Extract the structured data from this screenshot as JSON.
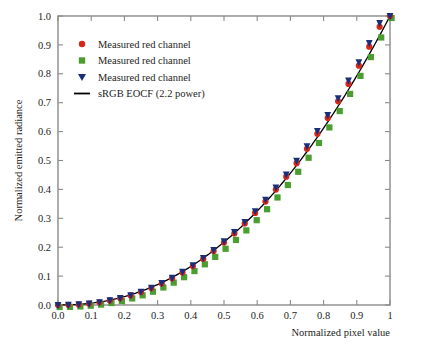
{
  "chart_data": {
    "type": "scatter",
    "title": "",
    "xlabel": "Normalized pixel value",
    "ylabel": "Normalized emitted radiance",
    "xlim": [
      0,
      1
    ],
    "ylim": [
      0,
      1
    ],
    "grid": false,
    "legend_position": "upper-left",
    "xticks": [
      0,
      0.1,
      0.2,
      0.3,
      0.4,
      0.5,
      0.6,
      0.7,
      0.8,
      0.9,
      1
    ],
    "xticklabels": [
      "0.0",
      "0.1",
      "0.2",
      "0.3",
      "0.4",
      "0.5",
      "0.6",
      "0.7",
      "0.8",
      "0.9",
      "1"
    ],
    "yticks": [
      0,
      0.1,
      0.2,
      0.3,
      0.4,
      0.5,
      0.6,
      0.7,
      0.8,
      0.9,
      1.0
    ],
    "yticklabels": [
      "0.0",
      "0.1",
      "0.2",
      "0.3",
      "0.4",
      "0.5",
      "0.6",
      "0.7",
      "0.8",
      "0.9",
      "1.0"
    ],
    "x": [
      0,
      0.03125,
      0.0625,
      0.09375,
      0.125,
      0.15625,
      0.1875,
      0.21875,
      0.25,
      0.28125,
      0.3125,
      0.34375,
      0.375,
      0.40625,
      0.4375,
      0.46875,
      0.5,
      0.53125,
      0.5625,
      0.59375,
      0.625,
      0.65625,
      0.6875,
      0.71875,
      0.75,
      0.78125,
      0.8125,
      0.84375,
      0.875,
      0.90625,
      0.9375,
      0.96875,
      1
    ],
    "series": [
      {
        "name": "Measured red channel",
        "marker": "circle",
        "color": "#d62718",
        "values": [
          0.0,
          0.0005,
          0.0021,
          0.0051,
          0.0095,
          0.0156,
          0.0235,
          0.0332,
          0.0449,
          0.0586,
          0.0744,
          0.0924,
          0.1125,
          0.1349,
          0.1596,
          0.1866,
          0.216,
          0.2478,
          0.282,
          0.3187,
          0.3579,
          0.3996,
          0.4439,
          0.4908,
          0.5403,
          0.5925,
          0.6473,
          0.7048,
          0.7651,
          0.8281,
          0.8939,
          0.9625,
          1.0
        ]
      },
      {
        "name": "Measured red channel",
        "marker": "square",
        "color": "#4a9e2f",
        "values": [
          0.0,
          0.0004,
          0.0018,
          0.0044,
          0.0083,
          0.0137,
          0.0208,
          0.0296,
          0.0403,
          0.0529,
          0.0675,
          0.0843,
          0.1032,
          0.1243,
          0.1477,
          0.1734,
          0.2015,
          0.232,
          0.265,
          0.3004,
          0.3384,
          0.379,
          0.4221,
          0.4679,
          0.5164,
          0.5675,
          0.6214,
          0.678,
          0.7374,
          0.7996,
          0.8647,
          0.9326,
          1.0
        ]
      },
      {
        "name": "Measured red channel",
        "marker": "triangle-down",
        "color": "#1a2e7a",
        "values": [
          0.0,
          0.0005,
          0.0022,
          0.0053,
          0.0098,
          0.016,
          0.0241,
          0.034,
          0.046,
          0.06,
          0.0761,
          0.0944,
          0.115,
          0.1378,
          0.1629,
          0.1904,
          0.2203,
          0.2526,
          0.2874,
          0.3246,
          0.3644,
          0.4067,
          0.4516,
          0.4991,
          0.5492,
          0.602,
          0.6574,
          0.7155,
          0.7764,
          0.8399,
          0.9063,
          0.9754,
          1.0
        ]
      }
    ],
    "reference_curve": {
      "name": "sRGB EOCF (2.2 power)",
      "color": "#000000",
      "exponent": 2.2
    },
    "legend": [
      {
        "label": "Measured red channel",
        "marker": "circle",
        "color": "#d62718"
      },
      {
        "label": "Measured red channel",
        "marker": "square",
        "color": "#4a9e2f"
      },
      {
        "label": "Measured red channel",
        "marker": "triangle-down",
        "color": "#1a2e7a"
      },
      {
        "label": "sRGB EOCF (2.2 power)",
        "marker": "line",
        "color": "#000000"
      }
    ]
  },
  "style": {
    "frame_color": "#8a8a8a",
    "background": "#ffffff",
    "text_color": "#1d1d1d"
  }
}
